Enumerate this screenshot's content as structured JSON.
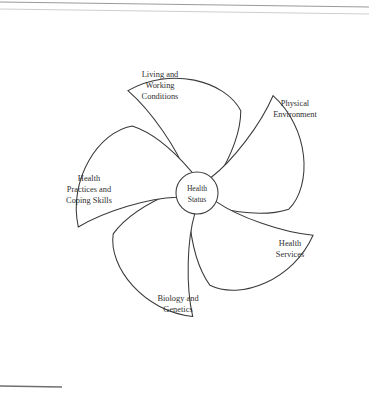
{
  "figure": {
    "type": "pinwheel-radial-diagram",
    "background_color": "#ffffff",
    "stroke_color": "#3a3a3a",
    "text_color": "#2f2f2f",
    "petal_count": 5
  },
  "hub": {
    "name": "health-status",
    "lines": [
      "Health",
      "Status"
    ],
    "line1": "Health",
    "line2": "Status",
    "center_x": 197,
    "center_y": 193,
    "radius": 21
  },
  "petals": [
    {
      "id": "living-and-working-conditions",
      "lines": [
        "Living and",
        "Working",
        "Conditions"
      ],
      "line1": "Living and",
      "line2": "Working",
      "line3": "Conditions",
      "angle_deg": 270,
      "label_x": 160,
      "label_y": 86
    },
    {
      "id": "physical-environment",
      "lines": [
        "Physical",
        "Environment"
      ],
      "line1": "Physical",
      "line2": "Environment",
      "line3": "",
      "angle_deg": 342,
      "label_x": 295,
      "label_y": 110
    },
    {
      "id": "health-services",
      "lines": [
        "Health",
        "Services"
      ],
      "line1": "Health",
      "line2": "Services",
      "line3": "",
      "angle_deg": 54,
      "label_x": 290,
      "label_y": 250
    },
    {
      "id": "biology-and-genetics",
      "lines": [
        "Biology and",
        "Genetics"
      ],
      "line1": "Biology and",
      "line2": "Genetics",
      "line3": "",
      "angle_deg": 126,
      "label_x": 178,
      "label_y": 305
    },
    {
      "id": "health-practices-and-coping-skills",
      "lines": [
        "Health",
        "Practices and",
        "Coping Skills"
      ],
      "line1": "Health",
      "line2": "Practices and",
      "line3": "Coping Skills",
      "angle_deg": 198,
      "label_x": 89,
      "label_y": 190
    }
  ],
  "marks": {
    "footnote_rule": {
      "name": "footnote-separator-rule",
      "x1": 0,
      "y1": 386,
      "x2": 62,
      "y2": 387
    },
    "scan_edge_top": {
      "name": "scan-edge-line",
      "x1": 0,
      "y1": 2,
      "x2": 369,
      "y2": 7
    }
  }
}
